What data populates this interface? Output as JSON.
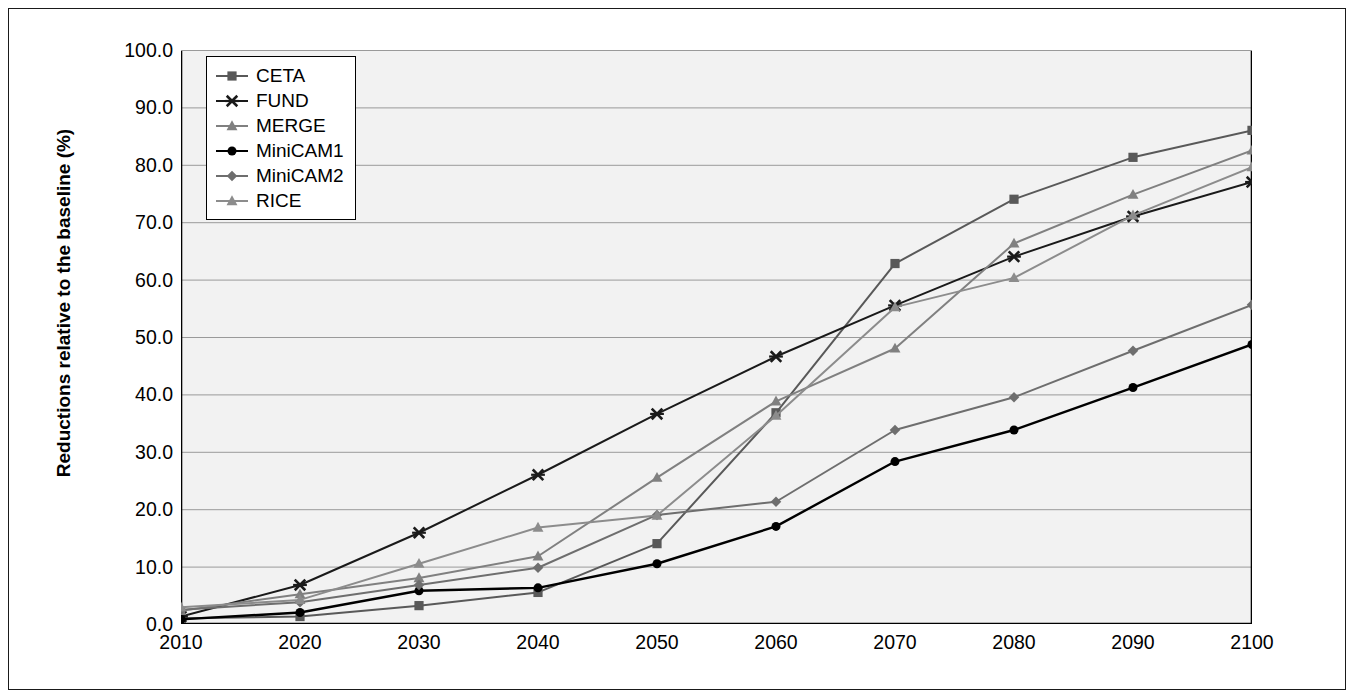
{
  "chart_data": {
    "type": "line",
    "title": "",
    "subtitle": "",
    "xlabel": "",
    "ylabel": "Reductions relative to the baseline (%)",
    "x": [
      2010,
      2020,
      2030,
      2040,
      2050,
      2060,
      2070,
      2080,
      2090,
      2100
    ],
    "xticklabels": [
      "2010",
      "2020",
      "2030",
      "2040",
      "2050",
      "2060",
      "2070",
      "2080",
      "2090",
      "2100"
    ],
    "yticklabels": [
      "0.0",
      "10.0",
      "20.0",
      "30.0",
      "40.0",
      "50.0",
      "60.0",
      "70.0",
      "80.0",
      "90.0",
      "100.0"
    ],
    "yticks": [
      0,
      10,
      20,
      30,
      40,
      50,
      60,
      70,
      80,
      90,
      100
    ],
    "xlim": [
      2010,
      2100
    ],
    "ylim": [
      0,
      100
    ],
    "grid": "horizontal",
    "legend_position": "top-left",
    "series": [
      {
        "name": "CETA",
        "marker": "square",
        "color": "#595959",
        "values": [
          1.0,
          1.3,
          3.2,
          5.5,
          14.0,
          36.8,
          62.8,
          74.0,
          81.3,
          86.0
        ]
      },
      {
        "name": "FUND",
        "marker": "x",
        "color": "#1a1a1a",
        "values": [
          1.3,
          6.8,
          15.9,
          26.0,
          36.6,
          46.6,
          55.5,
          64.0,
          71.0,
          77.0
        ]
      },
      {
        "name": "MERGE",
        "marker": "triangle",
        "color": "#808080",
        "values": [
          2.3,
          5.2,
          8.0,
          11.8,
          25.5,
          38.8,
          48.0,
          66.3,
          74.8,
          82.5
        ]
      },
      {
        "name": "MiniCAM1",
        "marker": "circle",
        "color": "#000000",
        "values": [
          0.8,
          2.0,
          5.8,
          6.3,
          10.5,
          17.0,
          28.3,
          33.8,
          41.2,
          48.7
        ]
      },
      {
        "name": "MiniCAM2",
        "marker": "diamond",
        "color": "#6e6e6e",
        "values": [
          2.5,
          3.8,
          6.8,
          9.8,
          19.0,
          21.3,
          33.8,
          39.5,
          47.6,
          55.6
        ]
      },
      {
        "name": "RICE",
        "marker": "triangle",
        "color": "#8c8c8c",
        "values": [
          2.9,
          4.2,
          10.5,
          16.8,
          18.9,
          36.3,
          55.2,
          60.3,
          71.2,
          79.6
        ]
      }
    ]
  },
  "legend": {
    "items": [
      {
        "label": "CETA"
      },
      {
        "label": "FUND"
      },
      {
        "label": "MERGE"
      },
      {
        "label": "MiniCAM1"
      },
      {
        "label": "MiniCAM2"
      },
      {
        "label": "RICE"
      }
    ]
  },
  "colors": {
    "plot_background": "#f2f2f2",
    "figure_background": "#ffffff",
    "axis": "#000000",
    "gridline": "#9a9a9a",
    "frame": "#1a1a1a"
  }
}
